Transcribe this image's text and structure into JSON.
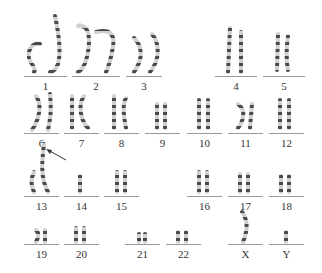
{
  "figure": {
    "type": "karyotype",
    "annotation": "arrow pointing to chromosome 13 short arm",
    "slots": [
      {
        "label": "1",
        "x": 24,
        "w": 43,
        "line_y": 76,
        "label_y": 80
      },
      {
        "label": "2",
        "x": 72,
        "w": 48,
        "line_y": 76,
        "label_y": 80
      },
      {
        "label": "3",
        "x": 126,
        "w": 36,
        "line_y": 76,
        "label_y": 80
      },
      {
        "label": "4",
        "x": 215,
        "w": 42,
        "line_y": 76,
        "label_y": 80
      },
      {
        "label": "5",
        "x": 263,
        "w": 42,
        "line_y": 76,
        "label_y": 80
      },
      {
        "label": "6",
        "x": 24,
        "w": 35,
        "line_y": 133,
        "label_y": 137
      },
      {
        "label": "7",
        "x": 64,
        "w": 35,
        "line_y": 133,
        "label_y": 137
      },
      {
        "label": "8",
        "x": 104,
        "w": 35,
        "line_y": 133,
        "label_y": 137
      },
      {
        "label": "9",
        "x": 145,
        "w": 35,
        "line_y": 133,
        "label_y": 137
      },
      {
        "label": "10",
        "x": 187,
        "w": 35,
        "line_y": 133,
        "label_y": 137
      },
      {
        "label": "11",
        "x": 228,
        "w": 35,
        "line_y": 133,
        "label_y": 137
      },
      {
        "label": "12",
        "x": 269,
        "w": 35,
        "line_y": 133,
        "label_y": 137
      },
      {
        "label": "13",
        "x": 24,
        "w": 35,
        "line_y": 196,
        "label_y": 200
      },
      {
        "label": "14",
        "x": 64,
        "w": 35,
        "line_y": 196,
        "label_y": 200
      },
      {
        "label": "15",
        "x": 104,
        "w": 35,
        "line_y": 196,
        "label_y": 200
      },
      {
        "label": "16",
        "x": 187,
        "w": 35,
        "line_y": 196,
        "label_y": 200
      },
      {
        "label": "17",
        "x": 228,
        "w": 35,
        "line_y": 196,
        "label_y": 200
      },
      {
        "label": "18",
        "x": 269,
        "w": 35,
        "line_y": 196,
        "label_y": 200
      },
      {
        "label": "19",
        "x": 24,
        "w": 35,
        "line_y": 244,
        "label_y": 248
      },
      {
        "label": "20",
        "x": 64,
        "w": 35,
        "line_y": 244,
        "label_y": 248
      },
      {
        "label": "21",
        "x": 125,
        "w": 35,
        "line_y": 244,
        "label_y": 248
      },
      {
        "label": "22",
        "x": 166,
        "w": 35,
        "line_y": 244,
        "label_y": 248
      },
      {
        "label": "X",
        "x": 228,
        "w": 35,
        "line_y": 244,
        "label_y": 248
      },
      {
        "label": "Y",
        "x": 269,
        "w": 35,
        "line_y": 244,
        "label_y": 248
      }
    ]
  }
}
